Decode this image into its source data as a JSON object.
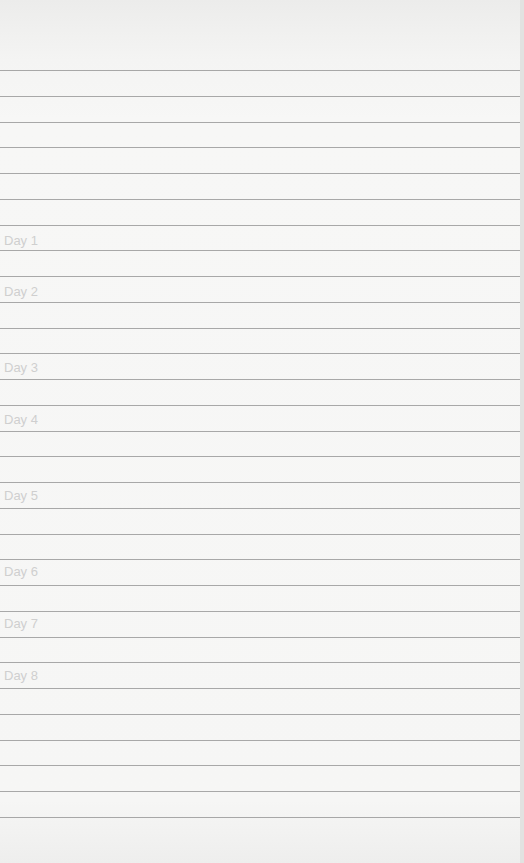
{
  "page": {
    "type": "lined-notebook-page",
    "heading": "",
    "days": [
      {
        "label": "Day 1",
        "top": 233
      },
      {
        "label": "Day 2",
        "top": 284
      },
      {
        "label": "Day 3",
        "top": 360
      },
      {
        "label": "Day 4",
        "top": 412
      },
      {
        "label": "Day 5",
        "top": 488
      },
      {
        "label": "Day 6",
        "top": 564
      },
      {
        "label": "Day 7",
        "top": 616
      },
      {
        "label": "Day 8",
        "top": 668
      }
    ],
    "rule_color": "#8d8d8d",
    "paper_color": "#f6f6f5"
  }
}
